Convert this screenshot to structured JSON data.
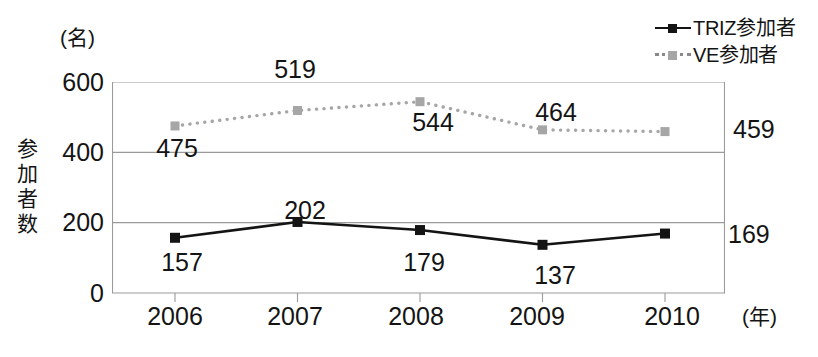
{
  "chart_data": {
    "type": "line",
    "title": "",
    "subtitle": "",
    "xlabel": "(年)",
    "ylabel": "参加者数",
    "yunit": "(名)",
    "categories": [
      "2006",
      "2007",
      "2008",
      "2009",
      "2010"
    ],
    "ylim": [
      0,
      600
    ],
    "yticks": [
      "0",
      "200",
      "400",
      "600"
    ],
    "ytick_values": [
      0,
      200,
      400,
      600
    ],
    "grid": "horizontal",
    "legend_position": "top-right",
    "series": [
      {
        "name": "TRIZ参加者",
        "style": "solid",
        "color": "#141414",
        "marker": "square",
        "values": [
          157,
          202,
          179,
          137,
          169
        ],
        "labels": [
          "157",
          "202",
          "179",
          "137",
          "169"
        ]
      },
      {
        "name": "VE参加者",
        "style": "dotted",
        "color": "#a6a6a6",
        "marker": "square",
        "values": [
          475,
          519,
          544,
          464,
          459
        ],
        "labels": [
          "475",
          "519",
          "544",
          "464",
          "459"
        ]
      }
    ]
  },
  "axis": {
    "y_title_chars": [
      "参",
      "加",
      "者",
      "数"
    ],
    "y_unit": "(名)",
    "x_unit": "(年)"
  },
  "legend": {
    "items": [
      {
        "label": "TRIZ参加者",
        "style": "solid"
      },
      {
        "label": "VE参加者",
        "style": "dotted"
      }
    ]
  }
}
